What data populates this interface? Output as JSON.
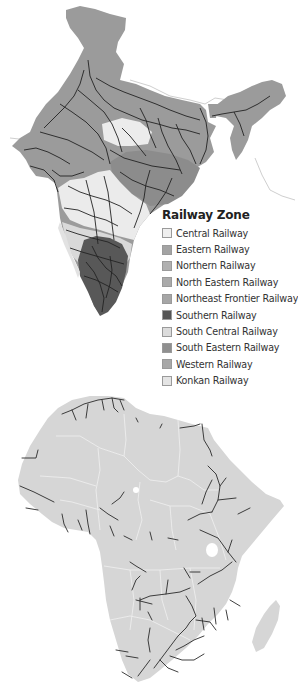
{
  "india_map": {
    "title": "India railway zones map",
    "land_color": "#9b9b9b",
    "rail_color": "#222222",
    "border_color": "#d8d8d8"
  },
  "legend": {
    "title": "Railway Zone",
    "items": [
      {
        "label": "Central Railway",
        "color": "#efefef"
      },
      {
        "label": "Eastern Railway",
        "color": "#a3a3a3"
      },
      {
        "label": "Northern Railway",
        "color": "#b0b0b0"
      },
      {
        "label": "North Eastern Railway",
        "color": "#aaaaaa"
      },
      {
        "label": "Northeast Frontier Railway",
        "color": "#a6a6a6"
      },
      {
        "label": "Southern Railway",
        "color": "#555555"
      },
      {
        "label": "South Central Railway",
        "color": "#dcdcdc"
      },
      {
        "label": "South Eastern Railway",
        "color": "#8f8f8f"
      },
      {
        "label": "Western Railway",
        "color": "#a8a8a8"
      },
      {
        "label": "Konkan Railway",
        "color": "#e4e4e4"
      }
    ]
  },
  "africa_map": {
    "title": "Africa railway map",
    "land_color": "#d6d6d6",
    "rail_color": "#2a2a2a",
    "border_color": "#f2f2f2"
  }
}
